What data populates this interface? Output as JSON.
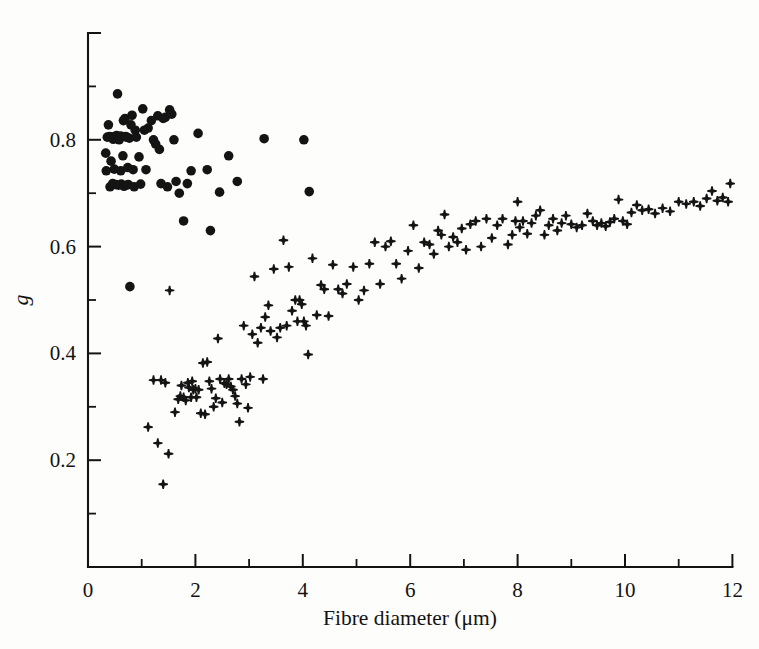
{
  "figure": {
    "background": "#fdfdfc",
    "ink_color": "#141414",
    "x_axis_label": "Fibre diameter (μm)",
    "y_axis_label": "g"
  },
  "chart_data": {
    "type": "scatter",
    "title": "",
    "xlabel": "Fibre diameter (μm)",
    "ylabel": "g",
    "xlim": [
      0,
      12
    ],
    "ylim": [
      0,
      1.0
    ],
    "xticks": [
      0,
      2,
      4,
      6,
      8,
      10,
      12
    ],
    "xticklabels": [
      "0",
      "2",
      "4",
      "6",
      "8",
      "10",
      "12"
    ],
    "xminorticks": [
      1,
      3,
      5,
      7,
      9,
      11
    ],
    "yticks": [
      0.2,
      0.4,
      0.6,
      0.8,
      1.0
    ],
    "yticklabels": [
      "0.2",
      "0.4",
      "0.6",
      "0.8",
      "1.0"
    ],
    "yminorticks": [
      0.1,
      0.3,
      0.5,
      0.7,
      0.9
    ],
    "grid": false,
    "legend": null,
    "series": [
      {
        "name": "filled-circle-series",
        "marker": "circle",
        "color": "#141414",
        "size": 9.6,
        "points": [
          [
            0.33,
            0.775
          ],
          [
            0.34,
            0.742
          ],
          [
            0.36,
            0.805
          ],
          [
            0.38,
            0.828
          ],
          [
            0.4,
            0.806
          ],
          [
            0.41,
            0.712
          ],
          [
            0.43,
            0.76
          ],
          [
            0.45,
            0.805
          ],
          [
            0.46,
            0.718
          ],
          [
            0.47,
            0.801
          ],
          [
            0.49,
            0.745
          ],
          [
            0.5,
            0.806
          ],
          [
            0.52,
            0.716
          ],
          [
            0.53,
            0.808
          ],
          [
            0.55,
            0.886
          ],
          [
            0.56,
            0.804
          ],
          [
            0.57,
            0.715
          ],
          [
            0.58,
            0.8
          ],
          [
            0.6,
            0.807
          ],
          [
            0.61,
            0.742
          ],
          [
            0.62,
            0.717
          ],
          [
            0.64,
            0.806
          ],
          [
            0.65,
            0.77
          ],
          [
            0.66,
            0.836
          ],
          [
            0.67,
            0.713
          ],
          [
            0.69,
            0.84
          ],
          [
            0.7,
            0.806
          ],
          [
            0.71,
            0.715
          ],
          [
            0.72,
            0.805
          ],
          [
            0.74,
            0.748
          ],
          [
            0.75,
            0.716
          ],
          [
            0.77,
            0.803
          ],
          [
            0.78,
            0.525
          ],
          [
            0.8,
            0.828
          ],
          [
            0.82,
            0.846
          ],
          [
            0.84,
            0.744
          ],
          [
            0.86,
            0.712
          ],
          [
            0.88,
            0.818
          ],
          [
            0.9,
            0.805
          ],
          [
            0.95,
            0.768
          ],
          [
            0.98,
            0.717
          ],
          [
            1.02,
            0.858
          ],
          [
            1.05,
            0.818
          ],
          [
            1.08,
            0.744
          ],
          [
            1.12,
            0.822
          ],
          [
            1.18,
            0.836
          ],
          [
            1.22,
            0.8
          ],
          [
            1.26,
            0.792
          ],
          [
            1.3,
            0.845
          ],
          [
            1.33,
            0.782
          ],
          [
            1.36,
            0.718
          ],
          [
            1.4,
            0.84
          ],
          [
            1.44,
            0.842
          ],
          [
            1.48,
            0.712
          ],
          [
            1.52,
            0.856
          ],
          [
            1.56,
            0.848
          ],
          [
            1.6,
            0.8
          ],
          [
            1.64,
            0.722
          ],
          [
            1.7,
            0.7
          ],
          [
            1.78,
            0.648
          ],
          [
            1.85,
            0.718
          ],
          [
            1.92,
            0.742
          ],
          [
            2.05,
            0.812
          ],
          [
            2.22,
            0.744
          ],
          [
            2.28,
            0.63
          ],
          [
            2.45,
            0.702
          ],
          [
            2.62,
            0.77
          ],
          [
            2.78,
            0.722
          ],
          [
            3.28,
            0.802
          ],
          [
            4.12,
            0.703
          ],
          [
            4.02,
            0.8
          ]
        ]
      },
      {
        "name": "plus-marker-series",
        "marker": "plus",
        "color": "#141414",
        "size": 9.5,
        "points": [
          [
            1.12,
            0.262
          ],
          [
            1.22,
            0.35
          ],
          [
            1.3,
            0.232
          ],
          [
            1.36,
            0.35
          ],
          [
            1.4,
            0.155
          ],
          [
            1.44,
            0.345
          ],
          [
            1.5,
            0.212
          ],
          [
            1.52,
            0.518
          ],
          [
            1.62,
            0.29
          ],
          [
            1.68,
            0.314
          ],
          [
            1.72,
            0.32
          ],
          [
            1.74,
            0.34
          ],
          [
            1.78,
            0.318
          ],
          [
            1.82,
            0.312
          ],
          [
            1.86,
            0.345
          ],
          [
            1.88,
            0.336
          ],
          [
            1.92,
            0.318
          ],
          [
            1.94,
            0.348
          ],
          [
            1.96,
            0.332
          ],
          [
            2.0,
            0.334
          ],
          [
            2.02,
            0.318
          ],
          [
            2.06,
            0.332
          ],
          [
            2.1,
            0.288
          ],
          [
            2.14,
            0.382
          ],
          [
            2.18,
            0.286
          ],
          [
            2.22,
            0.384
          ],
          [
            2.26,
            0.348
          ],
          [
            2.3,
            0.334
          ],
          [
            2.34,
            0.3
          ],
          [
            2.38,
            0.316
          ],
          [
            2.42,
            0.428
          ],
          [
            2.46,
            0.352
          ],
          [
            2.5,
            0.308
          ],
          [
            2.54,
            0.344
          ],
          [
            2.58,
            0.342
          ],
          [
            2.62,
            0.352
          ],
          [
            2.66,
            0.338
          ],
          [
            2.7,
            0.332
          ],
          [
            2.74,
            0.32
          ],
          [
            2.78,
            0.306
          ],
          [
            2.82,
            0.272
          ],
          [
            2.86,
            0.352
          ],
          [
            2.9,
            0.452
          ],
          [
            2.94,
            0.342
          ],
          [
            2.98,
            0.298
          ],
          [
            3.02,
            0.356
          ],
          [
            3.06,
            0.436
          ],
          [
            3.1,
            0.544
          ],
          [
            3.16,
            0.42
          ],
          [
            3.22,
            0.448
          ],
          [
            3.26,
            0.352
          ],
          [
            3.3,
            0.468
          ],
          [
            3.36,
            0.49
          ],
          [
            3.4,
            0.442
          ],
          [
            3.46,
            0.558
          ],
          [
            3.52,
            0.43
          ],
          [
            3.58,
            0.448
          ],
          [
            3.64,
            0.612
          ],
          [
            3.7,
            0.452
          ],
          [
            3.74,
            0.562
          ],
          [
            3.8,
            0.48
          ],
          [
            3.86,
            0.5
          ],
          [
            3.9,
            0.46
          ],
          [
            3.94,
            0.5
          ],
          [
            3.98,
            0.492
          ],
          [
            4.02,
            0.46
          ],
          [
            4.06,
            0.452
          ],
          [
            4.1,
            0.398
          ],
          [
            4.18,
            0.578
          ],
          [
            4.26,
            0.472
          ],
          [
            4.34,
            0.528
          ],
          [
            4.4,
            0.52
          ],
          [
            4.48,
            0.47
          ],
          [
            4.56,
            0.566
          ],
          [
            4.66,
            0.52
          ],
          [
            4.74,
            0.512
          ],
          [
            4.82,
            0.53
          ],
          [
            4.94,
            0.562
          ],
          [
            5.04,
            0.5
          ],
          [
            5.14,
            0.518
          ],
          [
            5.24,
            0.568
          ],
          [
            5.34,
            0.608
          ],
          [
            5.44,
            0.53
          ],
          [
            5.54,
            0.6
          ],
          [
            5.64,
            0.61
          ],
          [
            5.74,
            0.568
          ],
          [
            5.84,
            0.54
          ],
          [
            5.96,
            0.592
          ],
          [
            6.06,
            0.64
          ],
          [
            6.16,
            0.56
          ],
          [
            6.26,
            0.608
          ],
          [
            6.36,
            0.604
          ],
          [
            6.44,
            0.586
          ],
          [
            6.52,
            0.63
          ],
          [
            6.58,
            0.622
          ],
          [
            6.64,
            0.66
          ],
          [
            6.72,
            0.6
          ],
          [
            6.8,
            0.618
          ],
          [
            6.88,
            0.608
          ],
          [
            6.96,
            0.634
          ],
          [
            7.04,
            0.594
          ],
          [
            7.12,
            0.642
          ],
          [
            7.22,
            0.648
          ],
          [
            7.32,
            0.6
          ],
          [
            7.42,
            0.652
          ],
          [
            7.52,
            0.616
          ],
          [
            7.62,
            0.64
          ],
          [
            7.72,
            0.652
          ],
          [
            7.82,
            0.604
          ],
          [
            7.9,
            0.622
          ],
          [
            7.96,
            0.648
          ],
          [
            8.0,
            0.684
          ],
          [
            8.04,
            0.636
          ],
          [
            8.1,
            0.648
          ],
          [
            8.18,
            0.624
          ],
          [
            8.26,
            0.644
          ],
          [
            8.34,
            0.658
          ],
          [
            8.42,
            0.668
          ],
          [
            8.5,
            0.622
          ],
          [
            8.58,
            0.64
          ],
          [
            8.66,
            0.652
          ],
          [
            8.74,
            0.63
          ],
          [
            8.82,
            0.644
          ],
          [
            8.9,
            0.658
          ],
          [
            9.0,
            0.642
          ],
          [
            9.1,
            0.636
          ],
          [
            9.2,
            0.64
          ],
          [
            9.3,
            0.662
          ],
          [
            9.4,
            0.648
          ],
          [
            9.48,
            0.64
          ],
          [
            9.56,
            0.644
          ],
          [
            9.64,
            0.638
          ],
          [
            9.72,
            0.646
          ],
          [
            9.8,
            0.652
          ],
          [
            9.88,
            0.688
          ],
          [
            9.96,
            0.648
          ],
          [
            10.04,
            0.642
          ],
          [
            10.12,
            0.664
          ],
          [
            10.22,
            0.678
          ],
          [
            10.32,
            0.668
          ],
          [
            10.44,
            0.67
          ],
          [
            10.56,
            0.662
          ],
          [
            10.7,
            0.672
          ],
          [
            10.84,
            0.666
          ],
          [
            11.0,
            0.684
          ],
          [
            11.14,
            0.68
          ],
          [
            11.28,
            0.684
          ],
          [
            11.4,
            0.676
          ],
          [
            11.52,
            0.69
          ],
          [
            11.62,
            0.704
          ],
          [
            11.72,
            0.686
          ],
          [
            11.82,
            0.692
          ],
          [
            11.92,
            0.684
          ],
          [
            11.96,
            0.718
          ]
        ]
      }
    ]
  },
  "geometry": {
    "x0_px": 88,
    "y0_px": 567,
    "x_per_unit_px": 53.7,
    "y_per_unit_px": 534
  }
}
